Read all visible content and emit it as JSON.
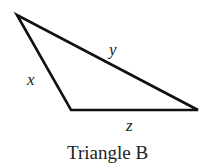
{
  "diagram": {
    "caption": "Triangle B",
    "side_labels": {
      "x": "x",
      "y": "y",
      "z": "z"
    },
    "vertices": {
      "top": [
        17,
        15
      ],
      "bottom_left": [
        71,
        110
      ],
      "bottom_right": [
        198,
        110
      ]
    },
    "stroke_color": "#111111"
  }
}
